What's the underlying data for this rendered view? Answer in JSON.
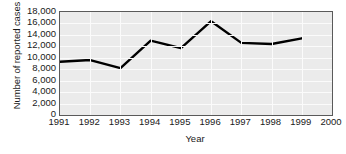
{
  "chart_data": {
    "type": "line",
    "title": "",
    "xlabel": "Year",
    "ylabel": "Number of reported cases",
    "categories": [
      1991,
      1992,
      1993,
      1994,
      1995,
      1996,
      1997,
      1998,
      1999
    ],
    "values": [
      9300,
      9600,
      8200,
      13000,
      11700,
      16400,
      12600,
      12400,
      13400
    ],
    "series": [
      {
        "name": "Number of reported cases",
        "values": [
          9300,
          9600,
          8200,
          13000,
          11700,
          16400,
          12600,
          12400,
          13400
        ]
      }
    ],
    "xlim": [
      1991,
      2000
    ],
    "ylim": [
      0,
      18000
    ],
    "x_ticks": [
      "1991",
      "1992",
      "1993",
      "1994",
      "1995",
      "1996",
      "1997",
      "1998",
      "1999",
      "2000"
    ],
    "x_tick_values": [
      1991,
      1992,
      1993,
      1994,
      1995,
      1996,
      1997,
      1998,
      1999,
      2000
    ],
    "y_ticks": [
      "0",
      "2,000",
      "4,000",
      "6,000",
      "8,000",
      "10,000",
      "12,000",
      "14,000",
      "16,000",
      "18,000"
    ],
    "y_tick_values": [
      0,
      2000,
      4000,
      6000,
      8000,
      10000,
      12000,
      14000,
      16000,
      18000
    ],
    "grid": true,
    "legend": "none",
    "colors": {
      "line": "#000000",
      "plot_background": "#ebebeb",
      "gridline": "#fbfbfb",
      "axis_border": "#5a5a5a",
      "text": "#1a1a1a",
      "figure_background": "#ffffff"
    },
    "line_width": 2.4
  }
}
